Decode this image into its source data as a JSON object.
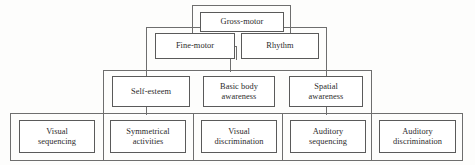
{
  "diagram": {
    "levels": [
      {
        "id": "level-1",
        "nodes": [
          {
            "id": "gross-motor",
            "label": "Gross-motor"
          }
        ]
      },
      {
        "id": "level-2",
        "nodes": [
          {
            "id": "fine-motor",
            "label": "Fine-motor"
          },
          {
            "id": "rhythm",
            "label": "Rhythm"
          }
        ]
      },
      {
        "id": "level-3",
        "nodes": [
          {
            "id": "self-esteem",
            "label": "Self-esteem"
          },
          {
            "id": "basic-body-awareness",
            "label": "Basic body\nawareness"
          },
          {
            "id": "spatial-awareness",
            "label": "Spatial\nawareness"
          }
        ]
      },
      {
        "id": "level-4",
        "nodes": [
          {
            "id": "visual-sequencing",
            "label": "Visual\nsequencing"
          },
          {
            "id": "symmetrical-activities",
            "label": "Symmetrical\nactivities"
          },
          {
            "id": "visual-discrimination",
            "label": "Visual\ndiscrimination"
          },
          {
            "id": "auditory-sequencing",
            "label": "Auditory\nsequencing"
          },
          {
            "id": "auditory-discrimination",
            "label": "Auditory\ndiscrimination"
          }
        ]
      }
    ],
    "colors": {
      "background": "#fdfdfc",
      "box_fill": "#ffffff",
      "box_border": "#5a5a5a",
      "frame_border": "#6e6e6e",
      "text": "#2b2b2b"
    }
  }
}
